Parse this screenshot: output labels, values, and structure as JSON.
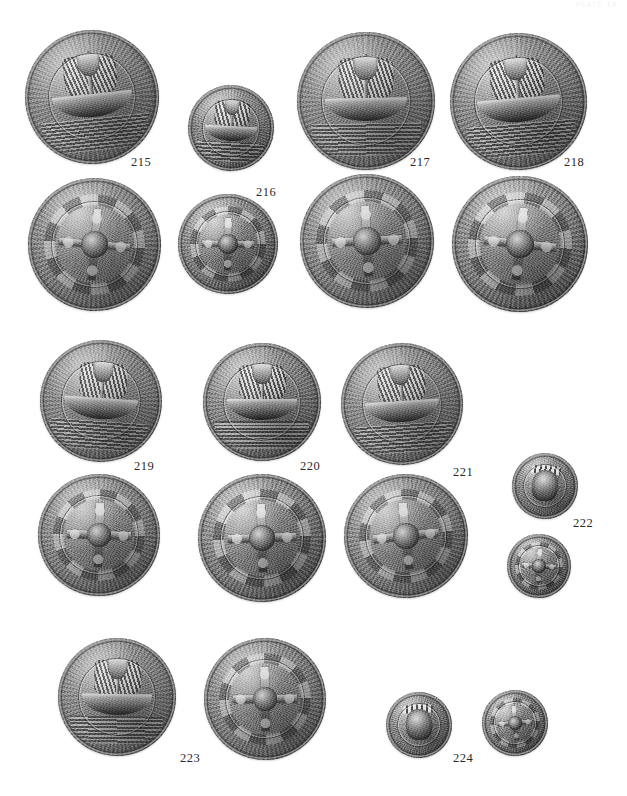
{
  "page": {
    "type": "numismatic-plate",
    "background_color": "#ffffff",
    "running_head": "PLATE 14",
    "width": 627,
    "height": 796
  },
  "captions": [
    {
      "id": "caption-215",
      "label": "215",
      "x": 131,
      "y": 155
    },
    {
      "id": "caption-216",
      "label": "216",
      "x": 256,
      "y": 185
    },
    {
      "id": "caption-217",
      "label": "217",
      "x": 410,
      "y": 155
    },
    {
      "id": "caption-218",
      "label": "218",
      "x": 564,
      "y": 155
    },
    {
      "id": "caption-219",
      "label": "219",
      "x": 134,
      "y": 459
    },
    {
      "id": "caption-220",
      "label": "220",
      "x": 300,
      "y": 459
    },
    {
      "id": "caption-221",
      "label": "221",
      "x": 453,
      "y": 465
    },
    {
      "id": "caption-222",
      "label": "222",
      "x": 573,
      "y": 516
    },
    {
      "id": "caption-223",
      "label": "223",
      "x": 180,
      "y": 751
    },
    {
      "id": "caption-224",
      "label": "224",
      "x": 453,
      "y": 751
    }
  ],
  "coins": [
    {
      "id": "coin-215-obverse",
      "catalog": "215",
      "side": "obverse",
      "motif": "ship",
      "x": 25,
      "y": 30,
      "size": 134
    },
    {
      "id": "coin-215-reverse",
      "catalog": "215",
      "side": "reverse",
      "motif": "cross",
      "x": 28,
      "y": 178,
      "size": 133
    },
    {
      "id": "coin-216-obverse",
      "catalog": "216",
      "side": "obverse",
      "motif": "ship",
      "x": 188,
      "y": 85,
      "size": 86
    },
    {
      "id": "coin-216-reverse",
      "catalog": "216",
      "side": "reverse",
      "motif": "cross",
      "x": 178,
      "y": 194,
      "size": 100
    },
    {
      "id": "coin-217-obverse",
      "catalog": "217",
      "side": "obverse",
      "motif": "ship",
      "x": 297,
      "y": 32,
      "size": 138
    },
    {
      "id": "coin-217-reverse",
      "catalog": "217",
      "side": "reverse",
      "motif": "cross",
      "x": 300,
      "y": 174,
      "size": 134
    },
    {
      "id": "coin-218-obverse",
      "catalog": "218",
      "side": "obverse",
      "motif": "ship",
      "x": 450,
      "y": 33,
      "size": 137
    },
    {
      "id": "coin-218-reverse",
      "catalog": "218",
      "side": "reverse",
      "motif": "cross",
      "x": 452,
      "y": 176,
      "size": 136
    },
    {
      "id": "coin-219-obverse",
      "catalog": "219",
      "side": "obverse",
      "motif": "ship",
      "x": 40,
      "y": 340,
      "size": 122
    },
    {
      "id": "coin-219-reverse",
      "catalog": "219",
      "side": "reverse",
      "motif": "cross",
      "x": 38,
      "y": 474,
      "size": 122
    },
    {
      "id": "coin-220-obverse",
      "catalog": "220",
      "side": "obverse",
      "motif": "ship",
      "x": 203,
      "y": 343,
      "size": 118
    },
    {
      "id": "coin-220-reverse",
      "catalog": "220",
      "side": "reverse",
      "motif": "cross",
      "x": 198,
      "y": 474,
      "size": 128
    },
    {
      "id": "coin-221-obverse",
      "catalog": "221",
      "side": "obverse",
      "motif": "ship",
      "x": 341,
      "y": 343,
      "size": 122
    },
    {
      "id": "coin-221-reverse",
      "catalog": "221",
      "side": "reverse",
      "motif": "cross",
      "x": 344,
      "y": 474,
      "size": 124
    },
    {
      "id": "coin-222-obverse",
      "catalog": "222",
      "side": "obverse",
      "motif": "bust",
      "x": 512,
      "y": 453,
      "size": 66
    },
    {
      "id": "coin-222-reverse",
      "catalog": "222",
      "side": "reverse",
      "motif": "cross",
      "x": 507,
      "y": 534,
      "size": 64
    },
    {
      "id": "coin-223-obverse",
      "catalog": "223",
      "side": "obverse",
      "motif": "ship",
      "x": 58,
      "y": 638,
      "size": 118
    },
    {
      "id": "coin-223-reverse",
      "catalog": "223",
      "side": "reverse",
      "motif": "cross",
      "x": 204,
      "y": 638,
      "size": 122
    },
    {
      "id": "coin-224-obverse",
      "catalog": "224",
      "side": "obverse",
      "motif": "bust",
      "x": 386,
      "y": 692,
      "size": 66
    },
    {
      "id": "coin-224-reverse",
      "catalog": "224",
      "side": "reverse",
      "motif": "cross",
      "x": 482,
      "y": 690,
      "size": 66
    }
  ]
}
